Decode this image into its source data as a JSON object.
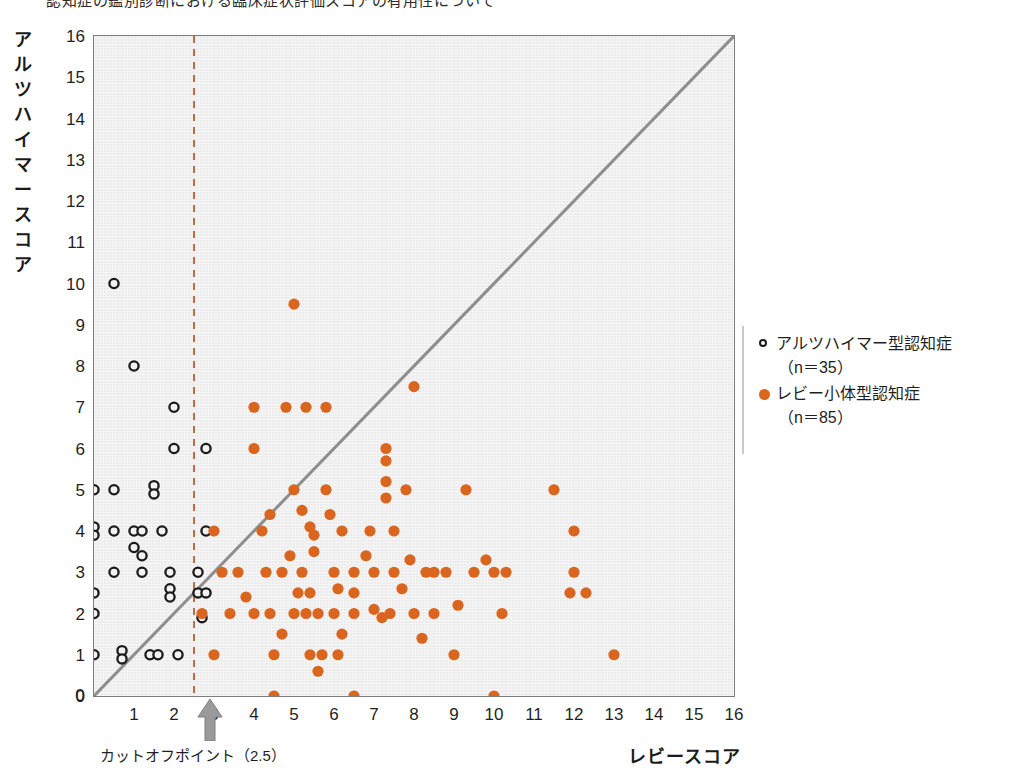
{
  "title_partial": "認知症の鑑別診断における臨床症状評価スコアの有用性について",
  "axes": {
    "ylabel": "アルツハイマースコア",
    "xlabel": "レビースコア",
    "yticks": [
      0,
      1,
      2,
      3,
      4,
      5,
      6,
      7,
      8,
      9,
      10,
      11,
      12,
      13,
      14,
      15,
      16
    ],
    "xticks": [
      0,
      1,
      2,
      3,
      4,
      5,
      6,
      7,
      8,
      9,
      10,
      11,
      12,
      13,
      14,
      15,
      16
    ],
    "xlim": [
      0,
      16
    ],
    "ylim": [
      0,
      16
    ]
  },
  "annotations": {
    "cutoff_label": "カットオフポイント（2.5）",
    "cutoff_value": 2.5,
    "identity_line": "y = x"
  },
  "legend": {
    "position": "right",
    "items": [
      {
        "marker": "open-circle",
        "color": "#1a1a1a",
        "label": "アルツハイマー型認知症",
        "sub": "（n＝35）",
        "n": 35
      },
      {
        "marker": "filled-circle",
        "color": "#d9651f",
        "label": "レビー小体型認知症",
        "sub": "（n＝85）",
        "n": 85
      }
    ]
  },
  "colors": {
    "plot_background": "#ececec",
    "frame": "#7d7d7d",
    "identity_line": "#8e8e8e",
    "cutoff_line": "#c96a3c",
    "ad_marker": "#1a1a1a",
    "dlb_marker": "#d9651f",
    "arrow": "#9a9a9a"
  },
  "chart_data": {
    "type": "scatter",
    "title": "",
    "xlabel": "レビースコア",
    "ylabel": "アルツハイマースコア",
    "xlim": [
      0,
      16
    ],
    "ylim": [
      0,
      16
    ],
    "grid": false,
    "legend_position": "right",
    "reference_lines": [
      {
        "kind": "identity",
        "label": "y = x",
        "from": [
          0,
          0
        ],
        "to": [
          16,
          16
        ],
        "color": "#8e8e8e"
      },
      {
        "kind": "vertical",
        "label": "カットオフポイント（2.5）",
        "x": 2.5,
        "style": "dashed",
        "color": "#c96a3c"
      }
    ],
    "series": [
      {
        "name": "アルツハイマー型認知症",
        "marker": "open-circle",
        "color": "#1a1a1a",
        "n": 35,
        "points": [
          [
            0.5,
            10
          ],
          [
            1,
            8
          ],
          [
            2,
            7
          ],
          [
            2,
            6
          ],
          [
            2.8,
            6
          ],
          [
            0,
            5
          ],
          [
            0.5,
            5
          ],
          [
            1.5,
            5.1
          ],
          [
            1.5,
            4.9
          ],
          [
            0,
            4.1
          ],
          [
            0,
            3.9
          ],
          [
            0.5,
            4
          ],
          [
            1,
            4
          ],
          [
            1.2,
            4
          ],
          [
            1.7,
            4
          ],
          [
            2.8,
            4
          ],
          [
            1,
            3.6
          ],
          [
            1.2,
            3.4
          ],
          [
            0.5,
            3
          ],
          [
            1.2,
            3
          ],
          [
            1.9,
            3
          ],
          [
            2.6,
            3
          ],
          [
            0,
            2.5
          ],
          [
            1.9,
            2.6
          ],
          [
            1.9,
            2.4
          ],
          [
            2.6,
            2.5
          ],
          [
            2.8,
            2.5
          ],
          [
            0,
            2
          ],
          [
            2.7,
            1.9
          ],
          [
            0,
            1
          ],
          [
            0.7,
            1.1
          ],
          [
            0.7,
            0.9
          ],
          [
            1.4,
            1
          ],
          [
            1.6,
            1
          ],
          [
            2.1,
            1
          ]
        ]
      },
      {
        "name": "レビー小体型認知症",
        "marker": "filled-circle",
        "color": "#d9651f",
        "n": 85,
        "points": [
          [
            5,
            9.5
          ],
          [
            8,
            7.5
          ],
          [
            4,
            7
          ],
          [
            4.8,
            7
          ],
          [
            5.3,
            7
          ],
          [
            5.8,
            7
          ],
          [
            4,
            6
          ],
          [
            7.3,
            6
          ],
          [
            7.3,
            5.7
          ],
          [
            5,
            5
          ],
          [
            5.8,
            5
          ],
          [
            7.3,
            5.2
          ],
          [
            7.3,
            4.8
          ],
          [
            7.8,
            5
          ],
          [
            9.3,
            5
          ],
          [
            11.5,
            5
          ],
          [
            3,
            4
          ],
          [
            4.2,
            4
          ],
          [
            5.4,
            4.1
          ],
          [
            5.5,
            3.9
          ],
          [
            6.2,
            4
          ],
          [
            6.9,
            4
          ],
          [
            7.5,
            4
          ],
          [
            12,
            4
          ],
          [
            5.5,
            3.5
          ],
          [
            5.2,
            4.5
          ],
          [
            3.2,
            3
          ],
          [
            3.6,
            3
          ],
          [
            4.3,
            3
          ],
          [
            4.7,
            3
          ],
          [
            5.2,
            3
          ],
          [
            6,
            3
          ],
          [
            6.5,
            3
          ],
          [
            7,
            3
          ],
          [
            7.5,
            3
          ],
          [
            8.3,
            3
          ],
          [
            8.5,
            3
          ],
          [
            8.8,
            3
          ],
          [
            9.5,
            3
          ],
          [
            10,
            3
          ],
          [
            10.3,
            3
          ],
          [
            12,
            3
          ],
          [
            6.5,
            2.5
          ],
          [
            5.1,
            2.5
          ],
          [
            5.4,
            2.5
          ],
          [
            11.9,
            2.5
          ],
          [
            12.3,
            2.5
          ],
          [
            2.7,
            2
          ],
          [
            3.4,
            2
          ],
          [
            4,
            2
          ],
          [
            4.4,
            2
          ],
          [
            5,
            2
          ],
          [
            5.3,
            2
          ],
          [
            5.6,
            2
          ],
          [
            6,
            2
          ],
          [
            6.5,
            2
          ],
          [
            7,
            2.1
          ],
          [
            7.2,
            1.9
          ],
          [
            7.4,
            2
          ],
          [
            8,
            2
          ],
          [
            8.5,
            2
          ],
          [
            10.2,
            2
          ],
          [
            4.7,
            1.5
          ],
          [
            6.2,
            1.5
          ],
          [
            3,
            1
          ],
          [
            4.5,
            1
          ],
          [
            5.4,
            1
          ],
          [
            5.7,
            1
          ],
          [
            6.1,
            1
          ],
          [
            9,
            1
          ],
          [
            13,
            1
          ],
          [
            5.6,
            0.6
          ],
          [
            4.5,
            0
          ],
          [
            6.5,
            0
          ],
          [
            10,
            0
          ],
          [
            9.8,
            3.3
          ],
          [
            7.9,
            3.3
          ],
          [
            6.1,
            2.6
          ],
          [
            4.9,
            3.4
          ],
          [
            8.2,
            1.4
          ],
          [
            3.8,
            2.4
          ],
          [
            7.7,
            2.6
          ],
          [
            6.8,
            3.4
          ],
          [
            5.9,
            4.4
          ],
          [
            4.4,
            4.4
          ],
          [
            9.1,
            2.2
          ]
        ]
      }
    ]
  }
}
